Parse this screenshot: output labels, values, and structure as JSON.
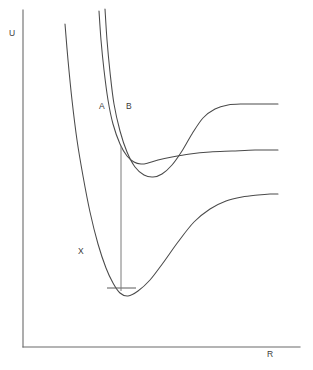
{
  "figure": {
    "background_color": "#ffffff",
    "line_color": "#4a4a4a",
    "axis_color": "#6a6a6a",
    "label_color": "#3a3a3a"
  },
  "axes": {
    "y_label": "U",
    "x_label": "R",
    "y_axis": {
      "x": 23,
      "y_top": 10,
      "y_bottom": 347
    },
    "x_axis": {
      "y": 347,
      "x_left": 23,
      "x_right": 300
    }
  },
  "curve_labels": [
    {
      "name": "label-X",
      "text": "X",
      "x": 78,
      "y": 254
    },
    {
      "name": "label-A",
      "text": "A",
      "x": 99,
      "y": 109
    },
    {
      "name": "label-B",
      "text": "B",
      "x": 126,
      "y": 109
    }
  ],
  "chart_data": {
    "type": "line",
    "title": "",
    "xlabel": "R",
    "ylabel": "U",
    "grid": false,
    "legend": "inline-curve-labels",
    "axis_ranges": {
      "x_pixels": [
        23,
        300
      ],
      "y_pixels": [
        10,
        347
      ]
    },
    "series": [
      {
        "name": "X",
        "label": "X",
        "minimum": {
          "x": 120,
          "y": 295
        },
        "asymptote_y": 195,
        "points": [
          [
            65,
            24
          ],
          [
            68,
            60
          ],
          [
            72,
            100
          ],
          [
            77,
            140
          ],
          [
            83,
            176
          ],
          [
            90,
            212
          ],
          [
            98,
            244
          ],
          [
            106,
            268
          ],
          [
            113,
            283
          ],
          [
            120,
            293
          ],
          [
            128,
            296
          ],
          [
            138,
            291
          ],
          [
            150,
            280
          ],
          [
            163,
            263
          ],
          [
            178,
            242
          ],
          [
            194,
            222
          ],
          [
            210,
            209
          ],
          [
            226,
            201
          ],
          [
            242,
            197
          ],
          [
            258,
            195
          ],
          [
            270,
            194
          ],
          [
            278,
            194
          ]
        ]
      },
      {
        "name": "A",
        "label": "A",
        "minimum": {
          "x": 146,
          "y": 163
        },
        "asymptote_y": 150,
        "points": [
          [
            99,
            11
          ],
          [
            101,
            40
          ],
          [
            104,
            70
          ],
          [
            108,
            100
          ],
          [
            113,
            124
          ],
          [
            120,
            144
          ],
          [
            127,
            156
          ],
          [
            134,
            162
          ],
          [
            141,
            164
          ],
          [
            148,
            163
          ],
          [
            158,
            160
          ],
          [
            172,
            157
          ],
          [
            190,
            154
          ],
          [
            210,
            152
          ],
          [
            232,
            151
          ],
          [
            255,
            150
          ],
          [
            270,
            150
          ],
          [
            278,
            150
          ]
        ]
      },
      {
        "name": "B",
        "label": "B",
        "minimum": {
          "x": 156,
          "y": 176
        },
        "asymptote_y": 105,
        "points": [
          [
            105,
            9
          ],
          [
            107,
            40
          ],
          [
            110,
            72
          ],
          [
            114,
            104
          ],
          [
            120,
            131
          ],
          [
            127,
            152
          ],
          [
            135,
            167
          ],
          [
            144,
            175
          ],
          [
            153,
            177
          ],
          [
            162,
            174
          ],
          [
            172,
            165
          ],
          [
            182,
            151
          ],
          [
            192,
            134
          ],
          [
            203,
            118
          ],
          [
            215,
            109
          ],
          [
            228,
            105
          ],
          [
            243,
            104
          ],
          [
            258,
            104
          ],
          [
            270,
            104
          ],
          [
            278,
            104
          ]
        ]
      }
    ],
    "annotations": [
      {
        "name": "vertical-transition",
        "type": "vertical-line",
        "x": 121,
        "y_top": 146,
        "y_bottom": 291
      },
      {
        "name": "ground-state-level",
        "type": "horizontal-level",
        "y": 288,
        "x_start": 107,
        "x_end": 136
      }
    ]
  }
}
